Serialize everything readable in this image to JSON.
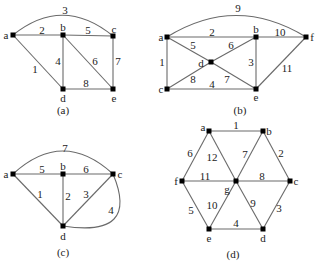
{
  "figure": {
    "graphs": [
      {
        "id": "a",
        "caption": "(a)",
        "caption_pos": [
          63,
          110
        ],
        "nodes": [
          {
            "name": "a",
            "x": 13,
            "y": 35,
            "lx": 6,
            "ly": 35
          },
          {
            "name": "b",
            "x": 63,
            "y": 35,
            "lx": 63,
            "ly": 27
          },
          {
            "name": "c",
            "x": 113,
            "y": 36,
            "lx": 114,
            "ly": 29
          },
          {
            "name": "d",
            "x": 63,
            "y": 89,
            "lx": 63,
            "ly": 98
          },
          {
            "name": "e",
            "x": 113,
            "y": 89,
            "lx": 114,
            "ly": 98
          }
        ],
        "edges": [
          {
            "from": "a",
            "to": "c",
            "weight": "3",
            "curve": true,
            "cx": 63,
            "cy": -5,
            "lx": 65,
            "ly": 10
          },
          {
            "from": "a",
            "to": "b",
            "weight": "2",
            "lx": 42,
            "ly": 30
          },
          {
            "from": "b",
            "to": "c",
            "weight": "5",
            "lx": 88,
            "ly": 30
          },
          {
            "from": "a",
            "to": "d",
            "weight": "1",
            "lx": 35,
            "ly": 69
          },
          {
            "from": "b",
            "to": "d",
            "weight": "4",
            "lx": 58,
            "ly": 61
          },
          {
            "from": "b",
            "to": "e",
            "weight": "6",
            "lx": 95,
            "ly": 61
          },
          {
            "from": "c",
            "to": "e",
            "weight": "7",
            "lx": 118,
            "ly": 61
          },
          {
            "from": "d",
            "to": "e",
            "weight": "8",
            "lx": 86,
            "ly": 83
          }
        ]
      },
      {
        "id": "b",
        "caption": "(b)",
        "caption_pos": [
          240,
          110
        ],
        "nodes": [
          {
            "name": "a",
            "x": 167,
            "y": 37,
            "lx": 161,
            "ly": 37
          },
          {
            "name": "b",
            "x": 256,
            "y": 37,
            "lx": 256,
            "ly": 29
          },
          {
            "name": "f",
            "x": 306,
            "y": 37,
            "lx": 312,
            "ly": 37
          },
          {
            "name": "d",
            "x": 211,
            "y": 62,
            "lx": 201,
            "ly": 63
          },
          {
            "name": "c",
            "x": 167,
            "y": 89,
            "lx": 161,
            "ly": 89
          },
          {
            "name": "e",
            "x": 256,
            "y": 89,
            "lx": 256,
            "ly": 97
          }
        ],
        "edges": [
          {
            "from": "a",
            "to": "f",
            "weight": "9",
            "curve": true,
            "cx": 236,
            "cy": -6,
            "lx": 238,
            "ly": 8
          },
          {
            "from": "a",
            "to": "b",
            "weight": "2",
            "lx": 212,
            "ly": 32
          },
          {
            "from": "b",
            "to": "f",
            "weight": "10",
            "lx": 280,
            "ly": 32
          },
          {
            "from": "a",
            "to": "c",
            "weight": "1",
            "lx": 162,
            "ly": 62
          },
          {
            "from": "a",
            "to": "d",
            "weight": "5",
            "lx": 193,
            "ly": 45
          },
          {
            "from": "d",
            "to": "b",
            "weight": "6",
            "lx": 231,
            "ly": 45
          },
          {
            "from": "c",
            "to": "d",
            "weight": "8",
            "lx": 193,
            "ly": 79
          },
          {
            "from": "d",
            "to": "e",
            "weight": "7",
            "lx": 227,
            "ly": 79
          },
          {
            "from": "c",
            "to": "e",
            "weight": "4",
            "lx": 212,
            "ly": 84
          },
          {
            "from": "b",
            "to": "e",
            "weight": "3",
            "lx": 251,
            "ly": 62
          },
          {
            "from": "e",
            "to": "f",
            "weight": "11",
            "lx": 287,
            "ly": 68
          }
        ]
      },
      {
        "id": "c",
        "caption": "(c)",
        "caption_pos": [
          63,
          252
        ],
        "nodes": [
          {
            "name": "a",
            "x": 13,
            "y": 174,
            "lx": 6,
            "ly": 174
          },
          {
            "name": "b",
            "x": 63,
            "y": 174,
            "lx": 63,
            "ly": 166
          },
          {
            "name": "c",
            "x": 113,
            "y": 174,
            "lx": 120,
            "ly": 174
          },
          {
            "name": "d",
            "x": 63,
            "y": 226,
            "lx": 63,
            "ly": 236
          }
        ],
        "edges": [
          {
            "from": "a",
            "to": "c",
            "weight": "7",
            "curve": true,
            "cx": 63,
            "cy": 128,
            "lx": 65,
            "ly": 148
          },
          {
            "from": "a",
            "to": "b",
            "weight": "5",
            "lx": 42,
            "ly": 169
          },
          {
            "from": "b",
            "to": "c",
            "weight": "6",
            "lx": 86,
            "ly": 169
          },
          {
            "from": "a",
            "to": "d",
            "weight": "1",
            "lx": 40,
            "ly": 194
          },
          {
            "from": "b",
            "to": "d",
            "weight": "2",
            "lx": 68,
            "ly": 196
          },
          {
            "from": "c",
            "to": "d",
            "weight": "3",
            "lx": 86,
            "ly": 194
          },
          {
            "from": "d",
            "to": "c",
            "weight": "4",
            "curve": true,
            "cx": 140,
            "cy": 238,
            "lx": 111,
            "ly": 210
          }
        ]
      },
      {
        "id": "d",
        "caption": "(d)",
        "caption_pos": [
          233,
          254
        ],
        "nodes": [
          {
            "name": "a",
            "x": 209,
            "y": 131,
            "lx": 203,
            "ly": 127
          },
          {
            "name": "b",
            "x": 263,
            "y": 131,
            "lx": 269,
            "ly": 131
          },
          {
            "name": "f",
            "x": 182,
            "y": 181,
            "lx": 176,
            "ly": 181
          },
          {
            "name": "g",
            "x": 236,
            "y": 181,
            "lx": 227,
            "ly": 189
          },
          {
            "name": "c",
            "x": 290,
            "y": 181,
            "lx": 296,
            "ly": 181
          },
          {
            "name": "e",
            "x": 209,
            "y": 229,
            "lx": 209,
            "ly": 238
          },
          {
            "name": "d",
            "x": 263,
            "y": 229,
            "lx": 263,
            "ly": 238
          }
        ],
        "edges": [
          {
            "from": "a",
            "to": "b",
            "weight": "1",
            "lx": 236,
            "ly": 125
          },
          {
            "from": "b",
            "to": "c",
            "weight": "2",
            "lx": 281,
            "ly": 153
          },
          {
            "from": "c",
            "to": "d",
            "weight": "3",
            "lx": 279,
            "ly": 208
          },
          {
            "from": "e",
            "to": "d",
            "weight": "4",
            "lx": 236,
            "ly": 223
          },
          {
            "from": "f",
            "to": "e",
            "weight": "5",
            "lx": 191,
            "ly": 210
          },
          {
            "from": "a",
            "to": "f",
            "weight": "6",
            "lx": 190,
            "ly": 153
          },
          {
            "from": "g",
            "to": "b",
            "weight": "7",
            "lx": 245,
            "ly": 154
          },
          {
            "from": "g",
            "to": "c",
            "weight": "8",
            "lx": 262,
            "ly": 176
          },
          {
            "from": "g",
            "to": "d",
            "weight": "9",
            "lx": 253,
            "ly": 203
          },
          {
            "from": "g",
            "to": "e",
            "weight": "10",
            "lx": 212,
            "ly": 205
          },
          {
            "from": "f",
            "to": "g",
            "weight": "11",
            "lx": 205,
            "ly": 176
          },
          {
            "from": "a",
            "to": "g",
            "weight": "12",
            "lx": 212,
            "ly": 157
          }
        ]
      }
    ]
  }
}
